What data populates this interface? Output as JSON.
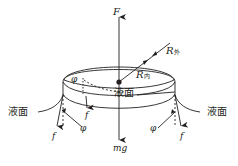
{
  "diagram": {
    "type": "physics-force-diagram",
    "stroke_color": "#231f20",
    "labels": {
      "F": "F",
      "mg": "mg",
      "R_outer_symbol": "R",
      "R_outer_sub": "外",
      "R_inner_symbol": "R",
      "R_inner_sub": "内",
      "liquid_surface_center": "液面",
      "liquid_surface_left": "液面",
      "liquid_surface_right": "液面",
      "phi_inner": "φ",
      "phi_left": "φ",
      "phi_right": "φ",
      "f_left_outer": "f",
      "f_left_inner": "f",
      "f_right": "f"
    }
  }
}
